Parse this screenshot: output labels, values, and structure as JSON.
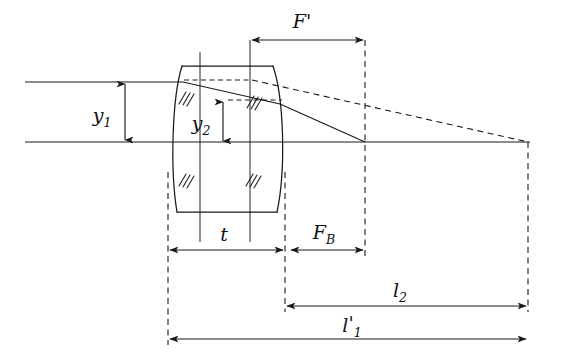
{
  "figure": {
    "kind": "optical-ray-diagram",
    "background_color": "#ffffff",
    "line_color": "#1a1a1a"
  },
  "labels": {
    "focal_length": "F",
    "focal_length_prime": "'",
    "back_focal": "F",
    "back_focal_sub": "B",
    "thickness": "t",
    "height_1": "y",
    "height_1_sub": "1",
    "height_2": "y",
    "height_2_sub": "2",
    "l2": "l",
    "l2_sub": "2",
    "l1_prime": "l",
    "l1_prime_mark": "'",
    "l1_prime_sub": "1"
  },
  "geometry": {
    "axis_y": 142,
    "axis_x_start": 25,
    "axis_x_end": 530,
    "ray_in_y": 82,
    "ray_in_x_start": 25,
    "lens_left_vertex_x": 168,
    "lens_right_vertex_x": 287,
    "lens_top_y": 66,
    "lens_bottom_y": 212,
    "focal_point_x": 365,
    "image_point_x": 528,
    "principal_plane_1_x": 200,
    "principal_plane_2_x": 250,
    "y2_line_y": 100
  },
  "dimensions": [
    {
      "name": "F'",
      "y": 40,
      "x1": 250,
      "x2": 365,
      "label_x": 302,
      "label_y": 28
    },
    {
      "name": "t",
      "y": 250,
      "x1": 168,
      "x2": 285,
      "label_x": 224,
      "label_y": 239
    },
    {
      "name": "F_B",
      "y": 250,
      "x1": 289,
      "x2": 365,
      "label_x": 324,
      "label_y": 236
    },
    {
      "name": "l_2",
      "y": 306,
      "x1": 285,
      "x2": 528,
      "label_x": 400,
      "label_y": 295
    },
    {
      "name": "l_1'",
      "y": 339,
      "x1": 168,
      "x2": 528,
      "label_x": 358,
      "label_y": 330
    }
  ],
  "heights": [
    {
      "name": "y_1",
      "x": 125,
      "y1": 82,
      "y2": 142,
      "label_x": 101,
      "label_y": 120
    },
    {
      "name": "y_2",
      "x": 223,
      "y1": 100,
      "y2": 143,
      "label_x": 200,
      "label_y": 128
    }
  ]
}
